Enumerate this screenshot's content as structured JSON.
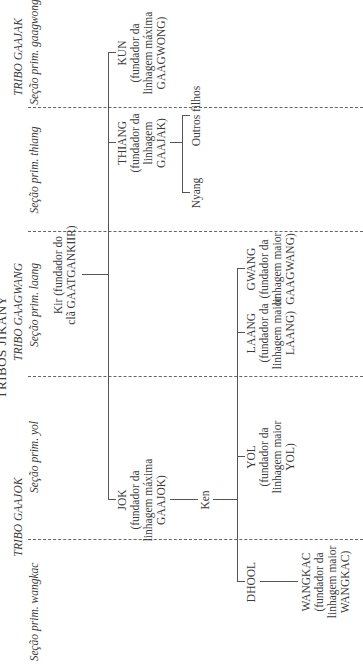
{
  "title": "TRIBOS JIKÁNY",
  "tribes": [
    {
      "label": "TRIBO GAAJOK"
    },
    {
      "label": "TRIBO GAAGWANG"
    },
    {
      "label": "TRIBO GAAJAK"
    }
  ],
  "sections": [
    {
      "label": "Seção prim. wangkac"
    },
    {
      "label": "Seção prim. yol"
    },
    {
      "label": "Seção prim. laang"
    },
    {
      "label": "Seção prim. thiang"
    },
    {
      "label": "Seção prim. gaagwong"
    }
  ],
  "nodes": {
    "kir": {
      "line1": "Kir (fundador do",
      "line2": "clã GAATGANKIIR)"
    },
    "jok": {
      "line1": "JOK",
      "line2": "(fundador da",
      "line3": "linhagem máxima",
      "line4": "GAAJOK)"
    },
    "thiang": {
      "line1": "THIANG",
      "line2": "(fundador da",
      "line3": "linhagem",
      "line4": "GAAJAK)"
    },
    "kun": {
      "line1": "KUN",
      "line2": "(fundador da",
      "line3": "linhagem máxima",
      "line4": "GAAGWONG)"
    },
    "ken": {
      "line1": "Ken"
    },
    "nyang": {
      "line1": "Nyang"
    },
    "outros": {
      "line1": "Outros filhos"
    },
    "dhool": {
      "line1": "DHOOL"
    },
    "yol": {
      "line1": "YOL",
      "line2": "(fundador da",
      "line3": "linhagem maior",
      "line4": "YOL)"
    },
    "laang": {
      "line1": "LAANG",
      "line2": "(fundador da",
      "line3": "linhagem maior",
      "line4": "LAANG)"
    },
    "gwang": {
      "line1": "GWANG",
      "line2": "(fundador da",
      "line3": "linhagem maior",
      "line4": "GAAGWANG)"
    },
    "wangkac": {
      "line1": "WANGKAC",
      "line2": "(fundador da",
      "line3": "linhagem maior",
      "line4": "WANGKAC)"
    }
  }
}
